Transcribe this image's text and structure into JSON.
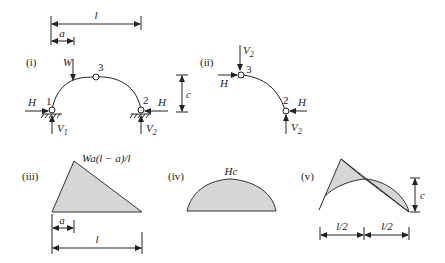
{
  "figure": {
    "dimensions": {
      "span_label": "l",
      "load_offset_label": "a",
      "rise_label": "c",
      "half_span_label": "l/2"
    },
    "panels": [
      {
        "id": "i",
        "label": "(i)",
        "description": "Three-pinned arch with point load",
        "load_label": "W",
        "crown_hinge_label": "3",
        "left_support_label": "1",
        "right_support_label": "2",
        "horizontal_reaction_label": "H",
        "left_vertical_reaction_label": "V",
        "left_vertical_reaction_sub": "1",
        "right_vertical_reaction_label": "V",
        "right_vertical_reaction_sub": "2"
      },
      {
        "id": "ii",
        "label": "(ii)",
        "description": "Free body of right half of arch",
        "top_force_label": "V",
        "top_force_sub": "2",
        "crown_hinge_label": "3",
        "support_label": "2",
        "horizontal_force_label": "H",
        "vertical_reaction_label": "V",
        "vertical_reaction_sub": "2"
      },
      {
        "id": "iii",
        "label": "(iii)",
        "description": "Simply-supported bending moment diagram",
        "peak_label": "Wa(l − a)/l"
      },
      {
        "id": "iv",
        "label": "(iv)",
        "description": "Moment due to horizontal thrust",
        "peak_label": "Hc"
      },
      {
        "id": "v",
        "label": "(v)",
        "description": "Combined bending moment diagram",
        "rise_label": "c",
        "left_half_label": "l/2",
        "right_half_label": "l/2"
      }
    ]
  }
}
